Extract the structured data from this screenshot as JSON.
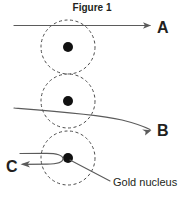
{
  "figure": {
    "title": "Figure 1",
    "title_x": 92,
    "title_y": 11
  },
  "nuclei": [
    {
      "id": "nucleus-top",
      "cx": 68,
      "cy": 47,
      "orbit_r": 27,
      "dot_r": 5
    },
    {
      "id": "nucleus-middle",
      "cx": 68,
      "cy": 101,
      "orbit_r": 27,
      "dot_r": 5
    },
    {
      "id": "nucleus-bottom",
      "cx": 68,
      "cy": 158,
      "orbit_r": 27,
      "dot_r": 5
    }
  ],
  "trajectories": [
    {
      "id": "trajectory-a",
      "label": "A",
      "description": "undeflected alpha particle passing above the nucleus",
      "label_x": 157,
      "label_y": 33,
      "path": "M14,25.5 L150,25.5",
      "arrow": "M151,25.5 L143,22.3 L145,25.5 L143,28.7 Z"
    },
    {
      "id": "trajectory-b",
      "label": "B",
      "description": "slightly deflected alpha particle passing close to the nucleus",
      "label_x": 157,
      "label_y": 136,
      "path": "M14,108 C54,111 96,114 122,120 C134,123 143,126 150,129.5",
      "arrow": "M151.5,130.2 L142.2,129.6 L145.6,131.8 L145.1,135.5 Z"
    },
    {
      "id": "trajectory-c",
      "label": "C",
      "description": "alpha particle backscattered by a head-on approach to the nucleus",
      "label_x": 6,
      "label_y": 172,
      "path": "M20,153.5 L46,153.3 C57,153.2 63,155.5 63,158.7 C63,162 57,164 47,164.1 L23,164.3",
      "arrow": "M20.5,164.3 L30,161 L27.6,164.3 L30,167.6 Z"
    }
  ],
  "callout": {
    "id": "gold-nucleus-callout",
    "label": "Gold nucleus",
    "label_x": 113,
    "label_y": 186,
    "leader_path": "M70,160 L110,181"
  }
}
